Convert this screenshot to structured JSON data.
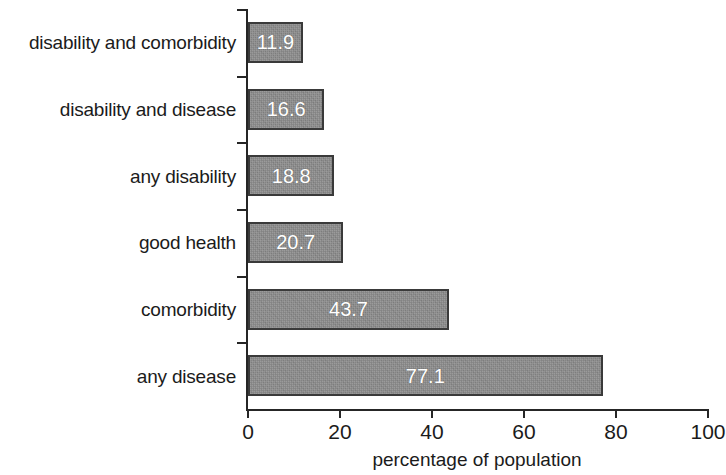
{
  "chart_data": {
    "type": "bar",
    "orientation": "horizontal",
    "title": "",
    "subtitle": "",
    "xlabel": "percentage of population",
    "ylabel": "",
    "xlim": [
      0,
      100
    ],
    "xticks": [
      "0",
      "20",
      "40",
      "60",
      "80",
      "100"
    ],
    "xtick_values": [
      0,
      20,
      40,
      60,
      80,
      100
    ],
    "grid": false,
    "legend": null,
    "categories": [
      "disability and comorbidity",
      "disability and disease",
      "any disability",
      "good health",
      "comorbidity",
      "any disease"
    ],
    "values": [
      11.9,
      16.6,
      18.8,
      20.7,
      43.7,
      77.1
    ],
    "value_labels": [
      "11.9",
      "16.6",
      "18.8",
      "20.7",
      "43.7",
      "77.1"
    ],
    "bars": [
      {
        "category": "disability and comorbidity",
        "value": 11.9,
        "label": "11.9"
      },
      {
        "category": "disability and disease",
        "value": 16.6,
        "label": "16.6"
      },
      {
        "category": "any disability",
        "value": 18.8,
        "label": "18.8"
      },
      {
        "category": "good health",
        "value": 20.7,
        "label": "20.7"
      },
      {
        "category": "comorbidity",
        "value": 43.7,
        "label": "43.7"
      },
      {
        "category": "any disease",
        "value": 77.1,
        "label": "77.1"
      }
    ],
    "colors": {
      "bar_fill": "#8d8d8d",
      "bar_border": "#3a3a3a",
      "value_label": "#ffffff",
      "axis": "#262626",
      "text": "#1b1b1b",
      "background": "#ffffff"
    }
  }
}
